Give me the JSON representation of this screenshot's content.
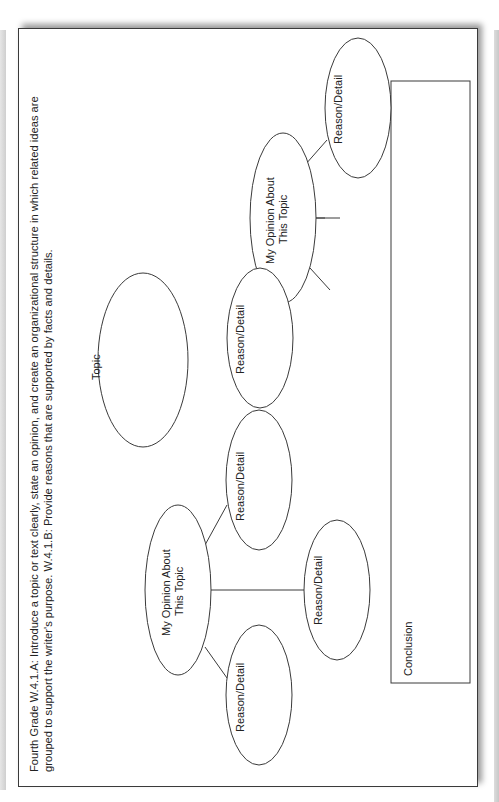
{
  "header": {
    "line1": "Fourth Grade W.4.1.A: Introduce a topic or text clearly, state an opinion, and create an organizational structure in which related ideas are",
    "line2": "grouped to support the writer's purpose. W.4.1.B: Provide reasons that are supported by facts and details."
  },
  "diagram": {
    "topic": "Topic",
    "opinion_left": {
      "line1": "My Opinion About",
      "line2": "This Topic"
    },
    "opinion_right": {
      "line1": "My Opinion About",
      "line2": "This Topic"
    },
    "reason_label": "Reason/Detail",
    "reasons_left": [
      "Reason/Detail",
      "Reason/Detail",
      "Reason/Detail"
    ],
    "reasons_right": [
      "Reason/Detail",
      "Reason/Detail",
      "Reason/Detail"
    ],
    "conclusion": "Conclusion"
  }
}
